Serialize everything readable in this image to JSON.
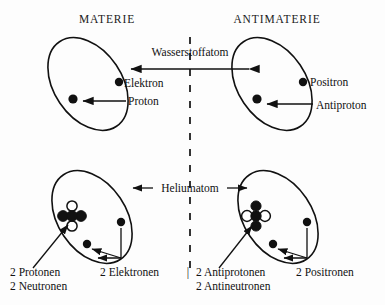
{
  "figure": {
    "title_left": "MATERIE",
    "title_right": "ANTIMATERIE",
    "divider": "dashed-vertical-line"
  },
  "hydrogen_row": {
    "connector_label": "Wasserstoffatom",
    "matter": {
      "orbit_label": "hydrogen-orbit",
      "particles": [
        {
          "name": "Elektron",
          "type": "filled-dot",
          "role": "orbital"
        },
        {
          "name": "Proton",
          "type": "filled-dot",
          "role": "nucleus"
        }
      ],
      "label_electron": "Elektron",
      "label_nucleus": "Proton"
    },
    "antimatter": {
      "orbit_label": "antihydrogen-orbit",
      "particles": [
        {
          "name": "Positron",
          "type": "filled-dot",
          "role": "orbital"
        },
        {
          "name": "Antiproton",
          "type": "filled-dot",
          "role": "nucleus"
        }
      ],
      "label_electron": "Positron",
      "label_nucleus": "Antiproton"
    }
  },
  "helium_row": {
    "connector_label": "Heliumatom",
    "matter": {
      "orbit_label": "helium-orbit",
      "nucleus_composition": [
        {
          "name": "Proton",
          "style": "filled"
        },
        {
          "name": "Proton",
          "style": "filled"
        },
        {
          "name": "Neutron",
          "style": "hollow"
        },
        {
          "name": "Neutron",
          "style": "hollow"
        }
      ],
      "label_nucleus_line1": "2 Protonen",
      "label_nucleus_line2": "2 Neutronen",
      "label_shell": "2 Elektronen"
    },
    "antimatter": {
      "orbit_label": "antihelium-orbit",
      "nucleus_composition": [
        {
          "name": "Antiproton",
          "style": "hollow"
        },
        {
          "name": "Antiproton",
          "style": "hollow"
        },
        {
          "name": "Antineutron",
          "style": "filled"
        },
        {
          "name": "Antineutron",
          "style": "filled"
        }
      ],
      "label_nucleus_line1": "2 Antiprotonen",
      "label_nucleus_line2": "2 Antineutronen",
      "label_shell": "2 Positronen"
    },
    "separator_glyph": "|"
  },
  "colors": {
    "ink": "#111111",
    "paper": "#fdfdfd"
  }
}
